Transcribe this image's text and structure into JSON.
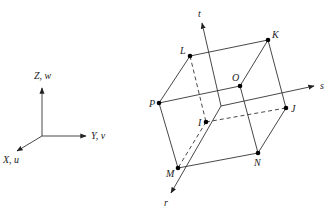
{
  "global_axes": {
    "origin": [
      42,
      136
    ],
    "z_label": "Z, w",
    "y_label": "Y, v",
    "x_label": "X, u"
  },
  "local_axes": {
    "t_label": "t",
    "s_label": "s",
    "r_label": "r"
  },
  "vertices": {
    "L": {
      "label": "L",
      "pos": [
        190,
        56
      ]
    },
    "K": {
      "label": "K",
      "pos": [
        268,
        40
      ]
    },
    "O": {
      "label": "O",
      "pos": [
        240,
        86
      ]
    },
    "P": {
      "label": "P",
      "pos": [
        159,
        103
      ]
    },
    "J": {
      "label": "J",
      "pos": [
        286,
        108
      ]
    },
    "I": {
      "label": "I",
      "pos": [
        206,
        122
      ]
    },
    "N": {
      "label": "N",
      "pos": [
        258,
        153
      ]
    },
    "M": {
      "label": "M",
      "pos": [
        178,
        168
      ]
    }
  },
  "colors": {
    "line": "#333333",
    "vertex": "#000000",
    "background": "#ffffff"
  }
}
